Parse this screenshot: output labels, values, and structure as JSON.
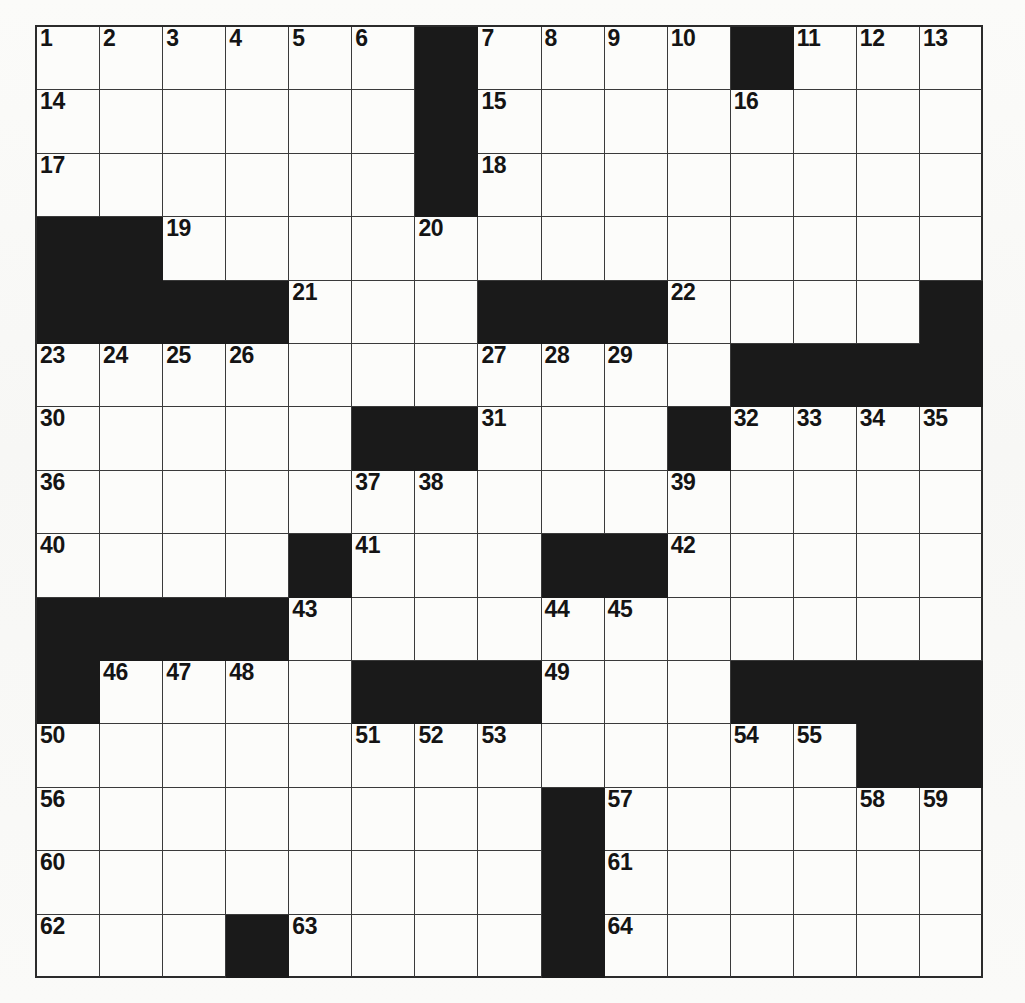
{
  "puzzle": {
    "title": "Crossword Puzzle Grid",
    "grid_size": {
      "rows": 15,
      "cols": 15
    },
    "colors": {
      "block": "#1a1a1a",
      "cell": "#fcfcfa",
      "grid_line": "#3a3a3a",
      "border": "#2b2b2b",
      "number": "#141414",
      "paper": "#fafaf8"
    },
    "max_clue_number": 64,
    "across_numbers": [
      1,
      14,
      15,
      16,
      17,
      18,
      19,
      20,
      21,
      22,
      23,
      27,
      30,
      31,
      32,
      36,
      39,
      40,
      41,
      42,
      43,
      46,
      49,
      50,
      54,
      56,
      57,
      60,
      61,
      62,
      63,
      64
    ],
    "down_numbers": [
      1,
      2,
      3,
      4,
      5,
      6,
      7,
      8,
      9,
      10,
      11,
      12,
      13,
      19,
      20,
      21,
      22,
      24,
      25,
      26,
      27,
      28,
      29,
      31,
      32,
      33,
      34,
      35,
      37,
      38,
      39,
      41,
      42,
      44,
      45,
      46,
      47,
      48,
      49,
      51,
      52,
      53,
      54,
      55,
      57,
      58,
      59
    ],
    "rows": [
      {
        "index": 0,
        "cells": [
          {
            "type": "open",
            "number": "1"
          },
          {
            "type": "open",
            "number": "2"
          },
          {
            "type": "open",
            "number": "3"
          },
          {
            "type": "open",
            "number": "4"
          },
          {
            "type": "open",
            "number": "5"
          },
          {
            "type": "open",
            "number": "6"
          },
          {
            "type": "block",
            "number": ""
          },
          {
            "type": "open",
            "number": "7"
          },
          {
            "type": "open",
            "number": "8"
          },
          {
            "type": "open",
            "number": "9"
          },
          {
            "type": "open",
            "number": "10"
          },
          {
            "type": "block",
            "number": ""
          },
          {
            "type": "open",
            "number": "11"
          },
          {
            "type": "open",
            "number": "12"
          },
          {
            "type": "open",
            "number": "13"
          }
        ]
      },
      {
        "index": 1,
        "cells": [
          {
            "type": "open",
            "number": "14"
          },
          {
            "type": "open",
            "number": ""
          },
          {
            "type": "open",
            "number": ""
          },
          {
            "type": "open",
            "number": ""
          },
          {
            "type": "open",
            "number": ""
          },
          {
            "type": "open",
            "number": ""
          },
          {
            "type": "block",
            "number": ""
          },
          {
            "type": "open",
            "number": "15"
          },
          {
            "type": "open",
            "number": ""
          },
          {
            "type": "open",
            "number": ""
          },
          {
            "type": "open",
            "number": ""
          },
          {
            "type": "open",
            "number": "16"
          },
          {
            "type": "open",
            "number": ""
          },
          {
            "type": "open",
            "number": ""
          },
          {
            "type": "open",
            "number": ""
          }
        ]
      },
      {
        "index": 2,
        "cells": [
          {
            "type": "open",
            "number": "17"
          },
          {
            "type": "open",
            "number": ""
          },
          {
            "type": "open",
            "number": ""
          },
          {
            "type": "open",
            "number": ""
          },
          {
            "type": "open",
            "number": ""
          },
          {
            "type": "open",
            "number": ""
          },
          {
            "type": "block",
            "number": ""
          },
          {
            "type": "open",
            "number": "18"
          },
          {
            "type": "open",
            "number": ""
          },
          {
            "type": "open",
            "number": ""
          },
          {
            "type": "open",
            "number": ""
          },
          {
            "type": "open",
            "number": ""
          },
          {
            "type": "open",
            "number": ""
          },
          {
            "type": "open",
            "number": ""
          },
          {
            "type": "open",
            "number": ""
          }
        ]
      },
      {
        "index": 3,
        "cells": [
          {
            "type": "block",
            "number": ""
          },
          {
            "type": "block",
            "number": ""
          },
          {
            "type": "open",
            "number": "19"
          },
          {
            "type": "open",
            "number": ""
          },
          {
            "type": "open",
            "number": ""
          },
          {
            "type": "open",
            "number": ""
          },
          {
            "type": "open",
            "number": "20"
          },
          {
            "type": "open",
            "number": ""
          },
          {
            "type": "open",
            "number": ""
          },
          {
            "type": "open",
            "number": ""
          },
          {
            "type": "open",
            "number": ""
          },
          {
            "type": "open",
            "number": ""
          },
          {
            "type": "open",
            "number": ""
          },
          {
            "type": "open",
            "number": ""
          },
          {
            "type": "open",
            "number": ""
          }
        ]
      },
      {
        "index": 4,
        "cells": [
          {
            "type": "block",
            "number": ""
          },
          {
            "type": "block",
            "number": ""
          },
          {
            "type": "block",
            "number": ""
          },
          {
            "type": "block",
            "number": ""
          },
          {
            "type": "open",
            "number": "21"
          },
          {
            "type": "open",
            "number": ""
          },
          {
            "type": "open",
            "number": ""
          },
          {
            "type": "block",
            "number": ""
          },
          {
            "type": "block",
            "number": ""
          },
          {
            "type": "block",
            "number": ""
          },
          {
            "type": "open",
            "number": "22"
          },
          {
            "type": "open",
            "number": ""
          },
          {
            "type": "open",
            "number": ""
          },
          {
            "type": "open",
            "number": ""
          },
          {
            "type": "block",
            "number": ""
          }
        ]
      },
      {
        "index": 5,
        "cells": [
          {
            "type": "open",
            "number": "23"
          },
          {
            "type": "open",
            "number": "24"
          },
          {
            "type": "open",
            "number": "25"
          },
          {
            "type": "open",
            "number": "26"
          },
          {
            "type": "open",
            "number": ""
          },
          {
            "type": "open",
            "number": ""
          },
          {
            "type": "open",
            "number": ""
          },
          {
            "type": "open",
            "number": "27"
          },
          {
            "type": "open",
            "number": "28"
          },
          {
            "type": "open",
            "number": "29"
          },
          {
            "type": "open",
            "number": ""
          },
          {
            "type": "block",
            "number": ""
          },
          {
            "type": "block",
            "number": ""
          },
          {
            "type": "block",
            "number": ""
          },
          {
            "type": "block",
            "number": ""
          }
        ]
      },
      {
        "index": 6,
        "cells": [
          {
            "type": "open",
            "number": "30"
          },
          {
            "type": "open",
            "number": ""
          },
          {
            "type": "open",
            "number": ""
          },
          {
            "type": "open",
            "number": ""
          },
          {
            "type": "open",
            "number": ""
          },
          {
            "type": "block",
            "number": ""
          },
          {
            "type": "block",
            "number": ""
          },
          {
            "type": "open",
            "number": "31"
          },
          {
            "type": "open",
            "number": ""
          },
          {
            "type": "open",
            "number": ""
          },
          {
            "type": "block",
            "number": ""
          },
          {
            "type": "open",
            "number": "32"
          },
          {
            "type": "open",
            "number": "33"
          },
          {
            "type": "open",
            "number": "34"
          },
          {
            "type": "open",
            "number": "35"
          }
        ]
      },
      {
        "index": 7,
        "cells": [
          {
            "type": "open",
            "number": "36"
          },
          {
            "type": "open",
            "number": ""
          },
          {
            "type": "open",
            "number": ""
          },
          {
            "type": "open",
            "number": ""
          },
          {
            "type": "open",
            "number": ""
          },
          {
            "type": "open",
            "number": "37"
          },
          {
            "type": "open",
            "number": "38"
          },
          {
            "type": "open",
            "number": ""
          },
          {
            "type": "open",
            "number": ""
          },
          {
            "type": "open",
            "number": ""
          },
          {
            "type": "open",
            "number": "39"
          },
          {
            "type": "open",
            "number": ""
          },
          {
            "type": "open",
            "number": ""
          },
          {
            "type": "open",
            "number": ""
          },
          {
            "type": "open",
            "number": ""
          }
        ]
      },
      {
        "index": 8,
        "cells": [
          {
            "type": "open",
            "number": "40"
          },
          {
            "type": "open",
            "number": ""
          },
          {
            "type": "open",
            "number": ""
          },
          {
            "type": "open",
            "number": ""
          },
          {
            "type": "block",
            "number": ""
          },
          {
            "type": "open",
            "number": "41"
          },
          {
            "type": "open",
            "number": ""
          },
          {
            "type": "open",
            "number": ""
          },
          {
            "type": "block",
            "number": ""
          },
          {
            "type": "block",
            "number": ""
          },
          {
            "type": "open",
            "number": "42"
          },
          {
            "type": "open",
            "number": ""
          },
          {
            "type": "open",
            "number": ""
          },
          {
            "type": "open",
            "number": ""
          },
          {
            "type": "open",
            "number": ""
          }
        ]
      },
      {
        "index": 9,
        "cells": [
          {
            "type": "block",
            "number": ""
          },
          {
            "type": "block",
            "number": ""
          },
          {
            "type": "block",
            "number": ""
          },
          {
            "type": "block",
            "number": ""
          },
          {
            "type": "open",
            "number": "43"
          },
          {
            "type": "open",
            "number": ""
          },
          {
            "type": "open",
            "number": ""
          },
          {
            "type": "open",
            "number": ""
          },
          {
            "type": "open",
            "number": "44"
          },
          {
            "type": "open",
            "number": "45"
          },
          {
            "type": "open",
            "number": ""
          },
          {
            "type": "open",
            "number": ""
          },
          {
            "type": "open",
            "number": ""
          },
          {
            "type": "open",
            "number": ""
          },
          {
            "type": "open",
            "number": ""
          }
        ]
      },
      {
        "index": 10,
        "cells": [
          {
            "type": "block",
            "number": ""
          },
          {
            "type": "open",
            "number": "46"
          },
          {
            "type": "open",
            "number": "47"
          },
          {
            "type": "open",
            "number": "48"
          },
          {
            "type": "open",
            "number": ""
          },
          {
            "type": "block",
            "number": ""
          },
          {
            "type": "block",
            "number": ""
          },
          {
            "type": "block",
            "number": ""
          },
          {
            "type": "open",
            "number": "49"
          },
          {
            "type": "open",
            "number": ""
          },
          {
            "type": "open",
            "number": ""
          },
          {
            "type": "block",
            "number": ""
          },
          {
            "type": "block",
            "number": ""
          },
          {
            "type": "block",
            "number": ""
          },
          {
            "type": "block",
            "number": ""
          }
        ]
      },
      {
        "index": 11,
        "cells": [
          {
            "type": "open",
            "number": "50"
          },
          {
            "type": "open",
            "number": ""
          },
          {
            "type": "open",
            "number": ""
          },
          {
            "type": "open",
            "number": ""
          },
          {
            "type": "open",
            "number": ""
          },
          {
            "type": "open",
            "number": "51"
          },
          {
            "type": "open",
            "number": "52"
          },
          {
            "type": "open",
            "number": "53"
          },
          {
            "type": "open",
            "number": ""
          },
          {
            "type": "open",
            "number": ""
          },
          {
            "type": "open",
            "number": ""
          },
          {
            "type": "open",
            "number": "54"
          },
          {
            "type": "open",
            "number": "55"
          },
          {
            "type": "block",
            "number": ""
          },
          {
            "type": "block",
            "number": ""
          }
        ]
      },
      {
        "index": 12,
        "cells": [
          {
            "type": "open",
            "number": "56"
          },
          {
            "type": "open",
            "number": ""
          },
          {
            "type": "open",
            "number": ""
          },
          {
            "type": "open",
            "number": ""
          },
          {
            "type": "open",
            "number": ""
          },
          {
            "type": "open",
            "number": ""
          },
          {
            "type": "open",
            "number": ""
          },
          {
            "type": "open",
            "number": ""
          },
          {
            "type": "block",
            "number": ""
          },
          {
            "type": "open",
            "number": "57"
          },
          {
            "type": "open",
            "number": ""
          },
          {
            "type": "open",
            "number": ""
          },
          {
            "type": "open",
            "number": ""
          },
          {
            "type": "open",
            "number": "58"
          },
          {
            "type": "open",
            "number": "59"
          }
        ]
      },
      {
        "index": 13,
        "cells": [
          {
            "type": "open",
            "number": "60"
          },
          {
            "type": "open",
            "number": ""
          },
          {
            "type": "open",
            "number": ""
          },
          {
            "type": "open",
            "number": ""
          },
          {
            "type": "open",
            "number": ""
          },
          {
            "type": "open",
            "number": ""
          },
          {
            "type": "open",
            "number": ""
          },
          {
            "type": "open",
            "number": ""
          },
          {
            "type": "block",
            "number": ""
          },
          {
            "type": "open",
            "number": "61"
          },
          {
            "type": "open",
            "number": ""
          },
          {
            "type": "open",
            "number": ""
          },
          {
            "type": "open",
            "number": ""
          },
          {
            "type": "open",
            "number": ""
          },
          {
            "type": "open",
            "number": ""
          }
        ]
      },
      {
        "index": 14,
        "cells": [
          {
            "type": "open",
            "number": "62"
          },
          {
            "type": "open",
            "number": ""
          },
          {
            "type": "open",
            "number": ""
          },
          {
            "type": "block",
            "number": ""
          },
          {
            "type": "open",
            "number": "63"
          },
          {
            "type": "open",
            "number": ""
          },
          {
            "type": "open",
            "number": ""
          },
          {
            "type": "open",
            "number": ""
          },
          {
            "type": "block",
            "number": ""
          },
          {
            "type": "open",
            "number": "64"
          },
          {
            "type": "open",
            "number": ""
          },
          {
            "type": "open",
            "number": ""
          },
          {
            "type": "open",
            "number": ""
          },
          {
            "type": "open",
            "number": ""
          },
          {
            "type": "open",
            "number": ""
          }
        ]
      }
    ]
  }
}
